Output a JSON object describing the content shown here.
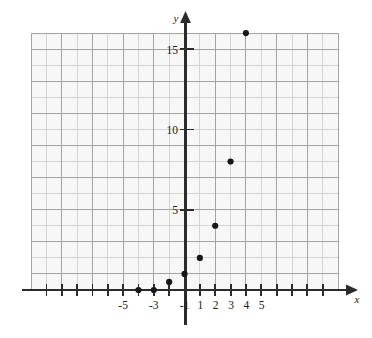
{
  "chart_data": {
    "type": "scatter",
    "title": "",
    "subtitle": "",
    "xlabel": "x",
    "ylabel": "y",
    "xlim": [
      -9,
      9
    ],
    "ylim": [
      -1.5,
      16.5
    ],
    "grid": true,
    "grid_minor_step": 1,
    "grid_major_step": 2,
    "legend": "none",
    "x_tick_labels": [
      "-5",
      "-3",
      "-1",
      "1",
      "2",
      "3",
      "4",
      "5"
    ],
    "x_tick_values": [
      -5,
      -3,
      -1,
      1,
      2,
      3,
      4,
      5
    ],
    "y_tick_labels": [
      "5",
      "10",
      "15"
    ],
    "y_tick_values": [
      5,
      10,
      15
    ],
    "x_tick_marks_all": [
      -9,
      -8,
      -7,
      -6,
      -5,
      -4,
      -3,
      -2,
      -1,
      1,
      2,
      3,
      4,
      5,
      6,
      7,
      8
    ],
    "points": [
      {
        "x": -3,
        "y": 0
      },
      {
        "x": -2,
        "y": 0
      },
      {
        "x": -1,
        "y": 0.5
      },
      {
        "x": 0,
        "y": 1
      },
      {
        "x": 1,
        "y": 2
      },
      {
        "x": 2,
        "y": 4
      },
      {
        "x": 3,
        "y": 8
      },
      {
        "x": 4,
        "y": 16
      }
    ],
    "series": [
      {
        "name": "",
        "x": [
          -3,
          -2,
          -1,
          0,
          1,
          2,
          3,
          4
        ],
        "values": [
          0,
          0,
          0.5,
          1,
          2,
          4,
          8,
          16
        ]
      }
    ],
    "annotations": [],
    "colors": {
      "point": "#171717",
      "axis": "#2b2b2b",
      "grid_minor": "#d2d2d2",
      "grid_major": "#9a9a9a",
      "plot_background": "#f7f7f7",
      "page_background": "#ffffff"
    }
  },
  "axes": {
    "x_axis_label": "x",
    "y_axis_label": "y"
  }
}
